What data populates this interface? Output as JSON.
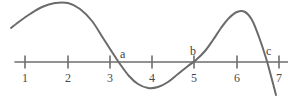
{
  "figure": {
    "title": "",
    "type": "function-graph-on-number-line",
    "background_color": "#ffffff",
    "curve_color": "#6b6b6b",
    "axis_color": "#6e6e6e",
    "label_color": "#4a4a4a"
  },
  "axis": {
    "name": "horizontal-number-line",
    "y_pixel": 62,
    "x_start_pixel": 15,
    "x_end_pixel": 288,
    "tick_spacing_pixel": 42,
    "ticks": [
      {
        "label": "1",
        "x_pixel": 25
      },
      {
        "label": "2",
        "x_pixel": 68
      },
      {
        "label": "3",
        "x_pixel": 110
      },
      {
        "label": "4",
        "x_pixel": 152
      },
      {
        "label": "5",
        "x_pixel": 194
      },
      {
        "label": "6",
        "x_pixel": 237
      },
      {
        "label": "7",
        "x_pixel": 279
      }
    ],
    "tick_label_y_pixel": 72
  },
  "point_labels": [
    {
      "label": "a",
      "x_pixel": 120,
      "y_pixel": 48
    },
    {
      "label": "b",
      "x_pixel": 190,
      "y_pixel": 45
    },
    {
      "label": "c",
      "x_pixel": 266,
      "y_pixel": 45
    }
  ],
  "chart_data": {
    "type": "line",
    "title": "",
    "xlabel": "",
    "ylabel": "",
    "xlim": [
      0.7,
      7.3
    ],
    "ylim": [
      -0.8,
      1.5
    ],
    "grid": false,
    "legend": null,
    "annotations": [
      "a",
      "b",
      "c"
    ],
    "zero_crossings": [
      {
        "label": "a",
        "x": 3.3
      },
      {
        "label": "b",
        "x": 5.05
      },
      {
        "label": "c",
        "x": 6.7
      }
    ],
    "extrema": [
      {
        "kind": "maximum",
        "x": 1.95,
        "y": 1.4
      },
      {
        "kind": "minimum",
        "x": 4.25,
        "y": -0.62
      },
      {
        "kind": "maximum",
        "x": 6.05,
        "y": 1.25
      }
    ],
    "series": [
      {
        "name": "curve",
        "path_points_pixel": [
          [
            11,
            28
          ],
          [
            20,
            21
          ],
          [
            30,
            14
          ],
          [
            42,
            7
          ],
          [
            55,
            3
          ],
          [
            68,
            3
          ],
          [
            80,
            9
          ],
          [
            92,
            21
          ],
          [
            103,
            38
          ],
          [
            112,
            52
          ],
          [
            120,
            64
          ],
          [
            129,
            76
          ],
          [
            138,
            84
          ],
          [
            148,
            88
          ],
          [
            158,
            87
          ],
          [
            168,
            82
          ],
          [
            178,
            74
          ],
          [
            188,
            66
          ],
          [
            196,
            60
          ],
          [
            205,
            51
          ],
          [
            213,
            40
          ],
          [
            221,
            28
          ],
          [
            229,
            18
          ],
          [
            237,
            12
          ],
          [
            245,
            12
          ],
          [
            252,
            20
          ],
          [
            259,
            37
          ],
          [
            266,
            58
          ],
          [
            271,
            76
          ],
          [
            276,
            95
          ]
        ]
      }
    ]
  }
}
